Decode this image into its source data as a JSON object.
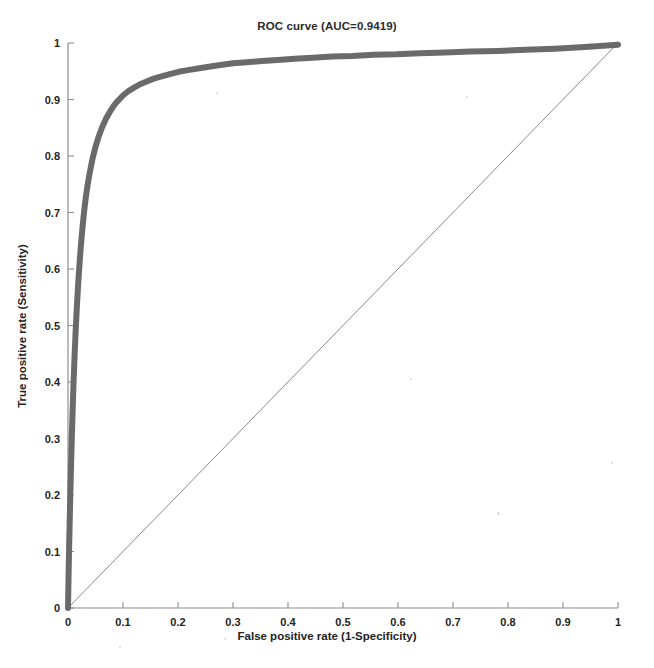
{
  "chart_data": {
    "type": "line",
    "title": "ROC curve (AUC=0.9419)",
    "xlabel": "False positive rate (1-Specificity)",
    "ylabel": "True positive rate (Sensitivity)",
    "xlim": [
      0,
      1
    ],
    "ylim": [
      0,
      1
    ],
    "grid": false,
    "legend": null,
    "auc": 0.9419,
    "xticks": [
      "0",
      "0.1",
      "0.2",
      "0.3",
      "0.4",
      "0.5",
      "0.6",
      "0.7",
      "0.8",
      "0.9",
      "1"
    ],
    "yticks": [
      "0",
      "0.1",
      "0.2",
      "0.3",
      "0.4",
      "0.5",
      "0.6",
      "0.7",
      "0.8",
      "0.9",
      "1"
    ],
    "xtick_values": [
      0,
      0.1,
      0.2,
      0.3,
      0.4,
      0.5,
      0.6,
      0.7,
      0.8,
      0.9,
      1
    ],
    "ytick_values": [
      0,
      0.1,
      0.2,
      0.3,
      0.4,
      0.5,
      0.6,
      0.7,
      0.8,
      0.9,
      1
    ],
    "series": [
      {
        "name": "ROC curve",
        "color": "#6a6a6a",
        "line_width": 6,
        "x": [
          0,
          0.001,
          0.002,
          0.003,
          0.004,
          0.005,
          0.006,
          0.007,
          0.008,
          0.009,
          0.01,
          0.012,
          0.014,
          0.016,
          0.018,
          0.02,
          0.023,
          0.026,
          0.029,
          0.032,
          0.036,
          0.04,
          0.045,
          0.05,
          0.056,
          0.062,
          0.069,
          0.076,
          0.084,
          0.092,
          0.101,
          0.11,
          0.12,
          0.131,
          0.143,
          0.156,
          0.17,
          0.185,
          0.201,
          0.218,
          0.236,
          0.256,
          0.277,
          0.3,
          0.325,
          0.352,
          0.381,
          0.412,
          0.445,
          0.48,
          0.517,
          0.556,
          0.597,
          0.64,
          0.685,
          0.732,
          0.781,
          0.832,
          0.885,
          0.94,
          1.0
        ],
        "y": [
          0,
          0.055,
          0.105,
          0.15,
          0.192,
          0.231,
          0.268,
          0.303,
          0.336,
          0.367,
          0.396,
          0.448,
          0.492,
          0.531,
          0.565,
          0.596,
          0.636,
          0.67,
          0.699,
          0.724,
          0.751,
          0.773,
          0.797,
          0.816,
          0.835,
          0.851,
          0.866,
          0.878,
          0.89,
          0.899,
          0.908,
          0.915,
          0.921,
          0.927,
          0.932,
          0.937,
          0.941,
          0.945,
          0.949,
          0.952,
          0.955,
          0.958,
          0.961,
          0.964,
          0.966,
          0.968,
          0.97,
          0.972,
          0.974,
          0.976,
          0.977,
          0.979,
          0.98,
          0.982,
          0.983,
          0.985,
          0.986,
          0.988,
          0.99,
          0.993,
          0.997
        ]
      },
      {
        "name": "chance diagonal",
        "color": "#8a8a8a",
        "line_width": 1,
        "x": [
          0,
          1
        ],
        "y": [
          0,
          1
        ]
      }
    ]
  }
}
